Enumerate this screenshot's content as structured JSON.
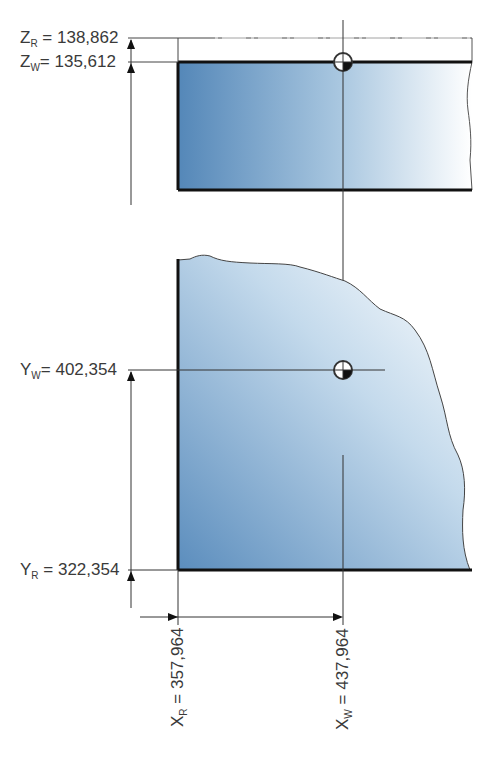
{
  "diagram": {
    "type": "workpiece reference point dimensioning",
    "views": [
      "side-view",
      "top-view"
    ],
    "colors": {
      "fill_dark": "#5b8dbd",
      "fill_light": "#ffffff",
      "edge": "#1a1a1a",
      "thin_line": "#333333",
      "text": "#3a3a3a"
    },
    "labels": {
      "z_r": {
        "var": "Z",
        "sub": "R",
        "eq": " = ",
        "value": "138,862"
      },
      "z_w": {
        "var": "Z",
        "sub": "W",
        "eq": "= ",
        "value": "135,612"
      },
      "y_w": {
        "var": "Y",
        "sub": "W",
        "eq": "= ",
        "value": "402,354"
      },
      "y_r": {
        "var": "Y",
        "sub": "R",
        "eq": " = ",
        "value": "322,354"
      },
      "x_r": {
        "var": "X",
        "sub": "R",
        "eq": " = ",
        "value": "357,964"
      },
      "x_w": {
        "var": "X",
        "sub": "W",
        "eq": " = ",
        "value": "437,964"
      }
    }
  }
}
